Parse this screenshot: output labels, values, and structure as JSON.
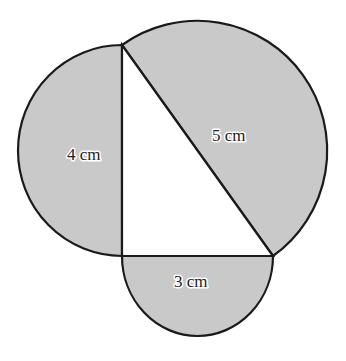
{
  "diagram": {
    "colors": {
      "fill": "#c9c9c9",
      "stroke": "#1a1a1a",
      "triangle_fill": "#ffffff",
      "background": "#ffffff"
    },
    "triangle": {
      "vertices": [
        [
          122,
          45
        ],
        [
          122,
          256
        ],
        [
          273,
          256
        ]
      ],
      "right_angle_at": [
        122,
        256
      ]
    },
    "labels": {
      "vertical_side": "4 cm",
      "hypotenuse": "5 cm",
      "horizontal_side": "3 cm"
    },
    "semicircles": [
      {
        "side": "vertical",
        "length": "4 cm",
        "position": "left"
      },
      {
        "side": "hypotenuse",
        "length": "5 cm",
        "position": "upper-right"
      },
      {
        "side": "horizontal",
        "length": "3 cm",
        "position": "below"
      }
    ]
  }
}
